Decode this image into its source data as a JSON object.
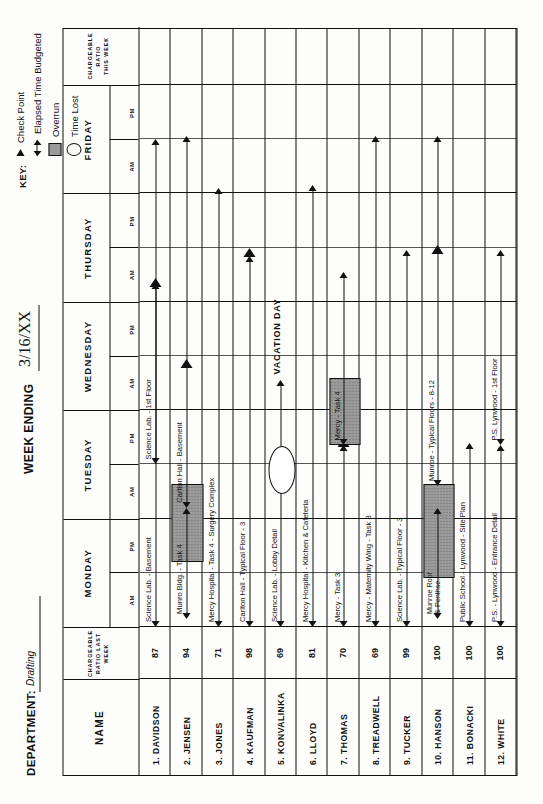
{
  "header": {
    "department_label": "DEPARTMENT:",
    "department_value": "Drafting",
    "week_ending_label": "WEEK ENDING",
    "week_ending_value": "3/16/XX"
  },
  "key": {
    "title": "KEY:",
    "items": [
      {
        "glyph": "check-point-triangle",
        "label": "Check Point"
      },
      {
        "glyph": "double-arrow",
        "label": "Elapsed Time Budgeted"
      },
      {
        "glyph": "hatched-box",
        "label": "Overrun"
      },
      {
        "glyph": "oval",
        "label": "Time Lost"
      }
    ]
  },
  "columns": {
    "name": "NAME",
    "ratio_last_week": [
      "CHARGEABLE",
      "RATIO LAST",
      "WEEK"
    ],
    "ratio_this_week": [
      "CHARGEABLE",
      "RATIO",
      "THIS WEEK"
    ],
    "days": [
      "MONDAY",
      "TUESDAY",
      "WEDNESDAY",
      "THURSDAY",
      "FRIDAY"
    ],
    "half_day": [
      "AM",
      "PM"
    ]
  },
  "chart_data": {
    "type": "bar",
    "xlabel": "Days of the week (AM / PM half-day units)",
    "ylabel": "Draftsman",
    "x": [
      "MONDAY AM",
      "MONDAY PM",
      "TUESDAY AM",
      "TUESDAY PM",
      "WEDNESDAY AM",
      "WEDNESDAY PM",
      "THURSDAY AM",
      "THURSDAY PM",
      "FRIDAY AM",
      "FRIDAY PM"
    ],
    "xlim": [
      0,
      10
    ],
    "grid": true,
    "legend": [
      "Check Point",
      "Elapsed Time Budgeted",
      "Overrun",
      "Time Lost"
    ],
    "rows": [
      {
        "num": "1.",
        "name": "DAVIDSON",
        "ratio": "87",
        "tasks": [
          {
            "label": "Science Lab. - Basement",
            "start": 0.0,
            "end": 6.35,
            "checkpoint": 6.35
          },
          {
            "label": "Science Lab. - 1st Floor",
            "start": 3.0,
            "end": 9.0,
            "checkpoint": null
          }
        ]
      },
      {
        "num": "2.",
        "name": "JENSEN",
        "ratio": "94",
        "tasks": [
          {
            "label": "Munro Bldg. - Task 4",
            "start": 0.15,
            "end": 2.2,
            "overrun": [
              1.2,
              2.6
            ],
            "checkpoint": null
          },
          {
            "label": "Carlton Hall - Basement",
            "start": 2.2,
            "end": 9.05,
            "checkpoint": 4.85
          }
        ]
      },
      {
        "num": "3.",
        "name": "JONES",
        "ratio": "71",
        "tasks": [
          {
            "label": "Mercy Hospital - Task 4 - Surgery Complex",
            "start": 0.0,
            "end": 8.1,
            "checkpoint": null
          }
        ]
      },
      {
        "num": "4.",
        "name": "KAUFMAN",
        "ratio": "98",
        "tasks": [
          {
            "label": "Carlton Hall - Typical Floor - 3",
            "start": 0.0,
            "end": 6.85,
            "checkpoint": 6.9
          }
        ]
      },
      {
        "num": "5.",
        "name": "KONVALINKA",
        "ratio": "69",
        "tasks": [
          {
            "label": "Science Lab. - Lobby Detail",
            "start": 0.0,
            "end": 4.55,
            "timelost": [
              2.45,
              3.3
            ],
            "checkpoint": null
          },
          {
            "label": "VACATION DAY",
            "start": 4.55,
            "end": 6.0,
            "vacation": true
          }
        ]
      },
      {
        "num": "6.",
        "name": "LLOYD",
        "ratio": "81",
        "tasks": [
          {
            "label": "Mercy Hospital - Kitchen & Cafeteria",
            "start": 0.0,
            "end": 8.15,
            "checkpoint": null
          }
        ]
      },
      {
        "num": "7.",
        "name": "THOMAS",
        "ratio": "70",
        "tasks": [
          {
            "label": "Mercy - Task 3",
            "start": 0.0,
            "end": 3.35,
            "checkpoint": 3.4
          },
          {
            "label": "Mercy - Task 4",
            "start": 3.35,
            "end": 6.55,
            "overrun": [
              3.35,
              4.55
            ]
          }
        ]
      },
      {
        "num": "8.",
        "name": "TREADWELL",
        "ratio": "69",
        "tasks": [
          {
            "label": "Mercy - Maternity Wing - Task 8",
            "start": 0.0,
            "end": 9.05,
            "checkpoint": null
          }
        ]
      },
      {
        "num": "9.",
        "name": "TUCKER",
        "ratio": "99",
        "tasks": [
          {
            "label": "Science Lab. - Typical Floor - 3",
            "start": 0.0,
            "end": 6.95,
            "checkpoint": null
          }
        ]
      },
      {
        "num": "10.",
        "name": "HANSON",
        "ratio": "100",
        "tasks": [
          {
            "label": "Munroe Roof & Penthse.",
            "start": 0.15,
            "end": 2.2,
            "overrun": [
              0.9,
              2.6
            ]
          },
          {
            "label": "Munroe - Typical Floors - 8-12",
            "start": 2.6,
            "end": 9.05,
            "checkpoint": 6.95
          }
        ]
      },
      {
        "num": "11.",
        "name": "BONACKI",
        "ratio": "100",
        "tasks": [
          {
            "label": "Public School - Lynwood - Site Plan",
            "start": 0.0,
            "end": 3.4,
            "checkpoint": null
          }
        ]
      },
      {
        "num": "12.",
        "name": "WHITE",
        "ratio": "100",
        "tasks": [
          {
            "label": "P.S. - Lynwood - Entrance Detail",
            "start": 0.0,
            "end": 3.35,
            "checkpoint": null
          },
          {
            "label": "P.S. Lynwood - 1st Floor",
            "start": 3.35,
            "end": 6.95,
            "checkpoint": null
          }
        ]
      }
    ]
  }
}
